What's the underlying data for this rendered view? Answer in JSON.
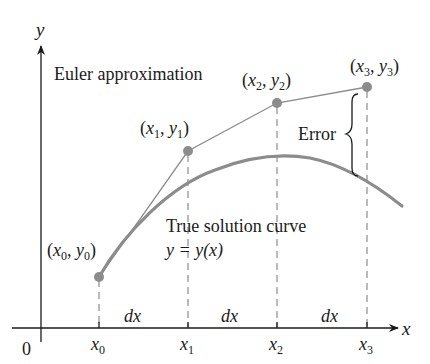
{
  "diagram": {
    "colors": {
      "axis": "#1a1a1a",
      "point": "#8c8c8c",
      "approx_line": "#8c8c8c",
      "true_curve": "#8c8c8c",
      "dashed": "#8c8c8c",
      "text": "#1a1a1a"
    },
    "axes": {
      "x_label": "x",
      "y_label": "y",
      "origin_label": "0"
    },
    "ticks": [
      {
        "label": "x",
        "sub": "0"
      },
      {
        "label": "x",
        "sub": "1"
      },
      {
        "label": "x",
        "sub": "2"
      },
      {
        "label": "x",
        "sub": "3"
      }
    ],
    "intervals": [
      "dx",
      "dx",
      "dx"
    ],
    "points": [
      {
        "x": "x",
        "xsub": "0",
        "y": "y",
        "ysub": "0"
      },
      {
        "x": "x",
        "xsub": "1",
        "y": "y",
        "ysub": "1"
      },
      {
        "x": "x",
        "xsub": "2",
        "y": "y",
        "ysub": "2"
      },
      {
        "x": "x",
        "xsub": "3",
        "y": "y",
        "ysub": "3"
      }
    ],
    "labels": {
      "euler": "Euler approximation",
      "true_curve_line1": "True solution curve",
      "true_curve_line2": "y = y(x)",
      "error": "Error"
    }
  }
}
